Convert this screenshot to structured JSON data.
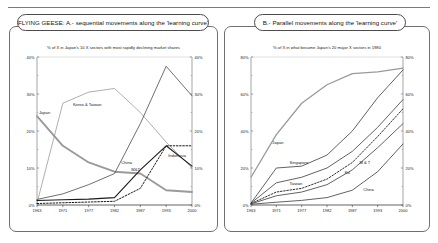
{
  "slide": {
    "callout_a": "FLYING GEESE:  A.- sequential movements along the 'learning curve'",
    "callout_b": "B.-  Parallel movements along the 'learning curve'"
  },
  "chart_data": [
    {
      "id": "chart-a",
      "type": "line",
      "title": "% of X in Japan's 10 X sectors with most rapidly declining market shares",
      "xlabel": "",
      "ylabel": "",
      "x": [
        "1963",
        "1971",
        "1977",
        "1982",
        "1987",
        "1993",
        "2000"
      ],
      "ylim": [
        0,
        40
      ],
      "yticks": [
        "0%",
        "10%",
        "20%",
        "30%",
        "40%"
      ],
      "grid": false,
      "legend": "inline-labels",
      "series": [
        {
          "name": "Japan",
          "label": "Japan",
          "color": "#9a9a9a",
          "width": 1.9,
          "dash": "none",
          "values": [
            24.0,
            16.0,
            11.5,
            9.0,
            8.5,
            4.0,
            3.5
          ]
        },
        {
          "name": "Korea & Taiwan",
          "label": "Korea & Taiwan",
          "color": "#8c8c8c",
          "width": 0.7,
          "dash": "none",
          "values": [
            0.5,
            27.5,
            30.5,
            31.5,
            25.0,
            17.0,
            10.0
          ]
        },
        {
          "name": "China",
          "label": "China",
          "color": "#4a4a4a",
          "width": 0.8,
          "dash": "none",
          "values": [
            1.5,
            3.0,
            5.5,
            8.5,
            22.0,
            37.5,
            29.5
          ]
        },
        {
          "name": "M&T",
          "label": "M&T",
          "color": "#1a1a1a",
          "width": 1.1,
          "dash": "none",
          "values": [
            1.2,
            1.4,
            1.6,
            2.0,
            9.5,
            16.0,
            10.5
          ]
        },
        {
          "name": "Indonesia",
          "label": "Indonesia",
          "color": "#1a1a1a",
          "width": 1.0,
          "dash": "dotted",
          "values": [
            0.4,
            0.6,
            0.8,
            1.0,
            4.5,
            16.0,
            16.0
          ]
        }
      ]
    },
    {
      "id": "chart-b",
      "type": "line",
      "title": "% of X in what became Japan's 20 major X sectors in 1980",
      "xlabel": "",
      "ylabel": "",
      "x": [
        "1963",
        "1971",
        "1977",
        "1982",
        "1987",
        "1993",
        "2000"
      ],
      "ylim": [
        0,
        80
      ],
      "yticks": [
        "0%",
        "20%",
        "40%",
        "60%",
        "80%"
      ],
      "grid": false,
      "legend": "inline-labels",
      "series": [
        {
          "name": "Japan",
          "label": "Japan",
          "color": "#9a9a9a",
          "width": 1.3,
          "dash": "none",
          "values": [
            15.0,
            38.0,
            55.0,
            65.0,
            71.0,
            72.0,
            74.0
          ]
        },
        {
          "name": "Singapore",
          "label": "Singapore",
          "color": "#3a3a3a",
          "width": 0.8,
          "dash": "none",
          "values": [
            1.0,
            20.0,
            21.0,
            27.0,
            40.0,
            58.0,
            73.0
          ]
        },
        {
          "name": "Taiwan",
          "label": "Taiwan",
          "color": "#3a3a3a",
          "width": 0.8,
          "dash": "none",
          "values": [
            1.0,
            12.0,
            15.0,
            20.0,
            29.0,
            42.0,
            57.0
          ]
        },
        {
          "name": "Ko.",
          "label": "Ko.",
          "color": "#1a1a1a",
          "width": 0.9,
          "dash": "dotted",
          "values": [
            0.8,
            7.0,
            9.0,
            14.0,
            23.0,
            37.0,
            52.0
          ]
        },
        {
          "name": "M & T",
          "label": "M & T",
          "color": "#3a3a3a",
          "width": 0.8,
          "dash": "none",
          "values": [
            0.6,
            5.0,
            7.0,
            11.0,
            19.0,
            31.0,
            44.0
          ]
        },
        {
          "name": "China",
          "label": "China",
          "color": "#3a3a3a",
          "width": 0.8,
          "dash": "none",
          "values": [
            0.4,
            1.5,
            2.5,
            4.0,
            8.0,
            18.0,
            33.0
          ]
        }
      ]
    }
  ]
}
